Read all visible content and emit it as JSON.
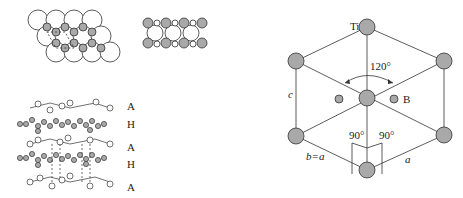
{
  "panels": {
    "top_left": {
      "name": "close-packed-layer-top-view"
    },
    "top_middle": {
      "name": "layer-side-view"
    },
    "bottom_left": {
      "name": "stacking-sequence",
      "layer_labels": [
        "A",
        "H",
        "A",
        "H",
        "A"
      ]
    },
    "right": {
      "name": "hexagonal-unit-cell",
      "atom_label_ti": "Ti",
      "atom_label_b": "B",
      "angle_120": "120°",
      "angle_90_left": "90°",
      "angle_90_right": "90°",
      "edge_c": "c",
      "edge_b": "b=a",
      "edge_a": "a"
    }
  },
  "colors": {
    "atom_gray": "#a9a9a9",
    "line": "#333333",
    "open_atom": "#ffffff"
  }
}
